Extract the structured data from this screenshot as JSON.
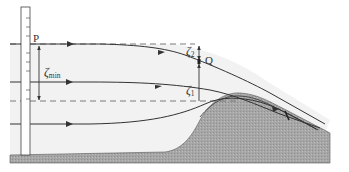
{
  "figure": {
    "type": "flow-over-obstacle diagram",
    "labels": {
      "point_p": "P",
      "point_q": "Q",
      "zeta_min": "ζ",
      "zeta_min_sub": "min",
      "zeta_1": "ζ",
      "zeta_1_sub": "1",
      "zeta_2": "ζ",
      "zeta_2_sub": "2"
    },
    "colors": {
      "fluid": "#f2f2f2",
      "ground": "#a9a9a9",
      "streamline": "#333333",
      "dashed": "#7a7a7a",
      "gauge": "#ffffff"
    }
  }
}
